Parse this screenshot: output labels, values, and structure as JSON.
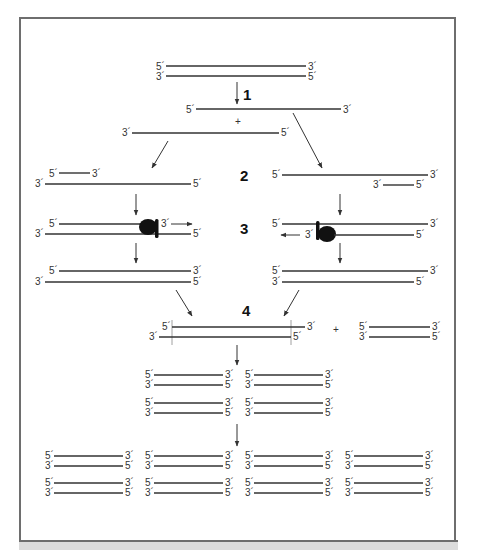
{
  "figure": {
    "type": "PCR amplification schematic",
    "steps": [
      {
        "id": "1",
        "label": "1"
      },
      {
        "id": "2",
        "label": "2"
      },
      {
        "id": "3",
        "label": "3"
      },
      {
        "id": "4",
        "label": "4"
      }
    ],
    "labels": {
      "five_prime": "5´",
      "three_prime": "3´",
      "plus": "+"
    },
    "colors": {
      "strand": "#333333",
      "frame": "#6e6e6e",
      "band": "#dcdcdc",
      "polymerase": "#111111"
    }
  }
}
